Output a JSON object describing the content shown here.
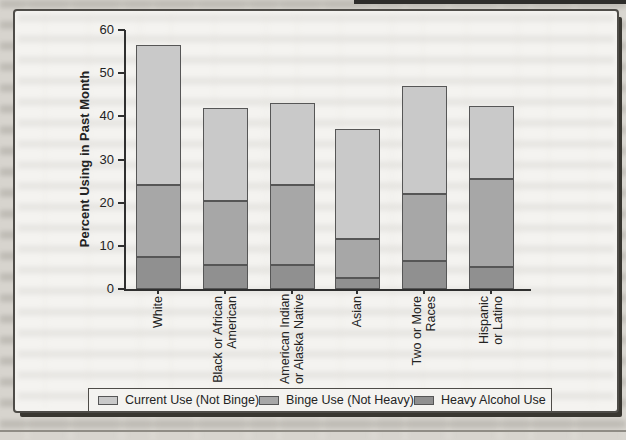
{
  "chart_data": {
    "type": "bar",
    "stacked": true,
    "ylabel": "Percent Using in Past Month",
    "xlabel": "",
    "ylim": [
      0,
      60
    ],
    "yticks": [
      0,
      10,
      20,
      30,
      40,
      50,
      60
    ],
    "grid": false,
    "legend_position": "bottom",
    "categories": [
      "White",
      "Black or African American",
      "American Indian or Alaska Native",
      "Asian",
      "Two or More Races",
      "Hispanic or Latino"
    ],
    "category_label_lines": [
      [
        "White"
      ],
      [
        "Black or African",
        "American"
      ],
      [
        "American Indian",
        "or Alaska Native"
      ],
      [
        "Asian"
      ],
      [
        "Two or More",
        "Races"
      ],
      [
        "Hispanic",
        "or Latino"
      ]
    ],
    "series": [
      {
        "name": "Heavy Alcohol Use",
        "color": "#909090",
        "values": [
          7.5,
          5.5,
          5.5,
          2.5,
          6.5,
          5.0
        ]
      },
      {
        "name": "Binge Use (Not Heavy)",
        "color": "#a7a7a7",
        "values": [
          16.5,
          15.0,
          18.5,
          9.0,
          15.5,
          20.5
        ]
      },
      {
        "name": "Current Use (Not Binge)",
        "color": "#c9c9c9",
        "values": [
          32.5,
          21.5,
          19.0,
          25.5,
          25.0,
          17.0
        ]
      }
    ],
    "stacked_totals": [
      56.5,
      42.0,
      43.0,
      37.0,
      47.0,
      42.5
    ],
    "legend": [
      "Current Use (Not Binge)",
      "Binge Use (Not Heavy)",
      "Heavy Alcohol Use"
    ]
  },
  "colors": {
    "page_bg": "#d7d4ce",
    "figure_bg": "#f4f3f0",
    "axis": "#2f2f2f",
    "frame_border": "#4e4c48",
    "segment_border": "#565656"
  }
}
